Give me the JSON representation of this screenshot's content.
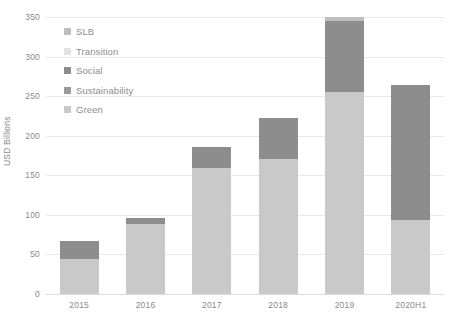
{
  "chart_data": {
    "type": "bar",
    "stacked": true,
    "title": "",
    "subtitle": "",
    "xlabel": "",
    "ylabel": "USD Billions",
    "ylim": [
      0,
      350
    ],
    "ytick_step": 50,
    "yticks": [
      "0",
      "50",
      "100",
      "150",
      "200",
      "250",
      "300",
      "350"
    ],
    "grid": true,
    "legend_position": "top-left-inside",
    "categories": [
      "2015",
      "2016",
      "2017",
      "2018",
      "2019",
      "2020H1"
    ],
    "series": [
      {
        "name": "Green",
        "color": "#c9c9c9",
        "values": [
          44,
          88,
          159,
          171,
          255,
          93
        ]
      },
      {
        "name": "Sustainability",
        "color": "#9a9a9a",
        "values": [
          0,
          0,
          0,
          0,
          0,
          0
        ]
      },
      {
        "name": "Social",
        "color": "#8d8d8d",
        "values": [
          23,
          8,
          27,
          52,
          90,
          171
        ]
      },
      {
        "name": "Transition",
        "color": "#e2e2e2",
        "values": [
          0,
          0,
          0,
          0,
          0,
          0
        ]
      },
      {
        "name": "SLB",
        "color": "#bdbdbd",
        "values": [
          0,
          0,
          0,
          0,
          5,
          0
        ]
      }
    ],
    "totals": [
      67,
      96,
      186,
      223,
      350,
      264
    ],
    "legend_order": [
      "SLB",
      "Transition",
      "Social",
      "Sustainability",
      "Green"
    ]
  },
  "legend": {
    "items": [
      {
        "label": "SLB",
        "color": "#bdbdbd"
      },
      {
        "label": "Transition",
        "color": "#e2e2e2"
      },
      {
        "label": "Social",
        "color": "#8d8d8d"
      },
      {
        "label": "Sustainability",
        "color": "#9a9a9a"
      },
      {
        "label": "Green",
        "color": "#c9c9c9"
      }
    ]
  },
  "axes": {
    "y_title": "USD Billions",
    "y_labels": [
      "350",
      "300",
      "250",
      "200",
      "150",
      "100",
      "50",
      "0"
    ],
    "x_labels": [
      "2015",
      "2016",
      "2017",
      "2018",
      "2019",
      "2020H1"
    ]
  },
  "colors": {
    "grid": "#e8e8e8",
    "text": "#8a8a8a",
    "background": "#ffffff"
  }
}
